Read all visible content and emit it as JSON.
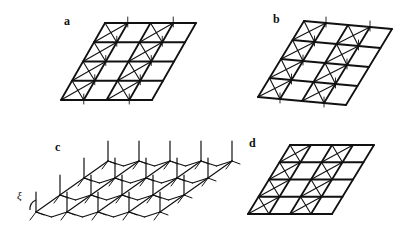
{
  "panels": [
    {
      "label": "a",
      "description": "rhombic lattice with crossed diagonals and vertical ticks"
    },
    {
      "label": "b",
      "description": "distorted (buckled) rhombic lattice with crossed diagonals"
    },
    {
      "label": "c",
      "description": "3D perspective lattice with vertical rods"
    },
    {
      "label": "d",
      "description": "flat rhombic lattice with crossed diagonals"
    }
  ],
  "annotations": {
    "angle_symbol": "ξ"
  },
  "colors": {
    "line": "#111111",
    "background": "#ffffff"
  }
}
